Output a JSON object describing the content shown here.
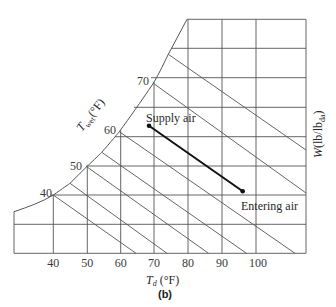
{
  "chart_data": {
    "type": "psychrometric",
    "title": "",
    "panel_label": "(b)",
    "xlabel": "T_d (°F)",
    "xlabel_main": "T",
    "xlabel_sub": "d",
    "xlabel_unit": " (°F)",
    "ylabel": "W(lb/lb_da)",
    "ylabel_main": "W(lb/lb",
    "ylabel_sub": "da",
    "ylabel_close": ")",
    "wetbulb_label": "T_wet(°F)",
    "wetbulb_main": "T",
    "wetbulb_sub": "wet",
    "wetbulb_unit": "(°F)",
    "x_ticks": [
      "40",
      "50",
      "60",
      "70",
      "80",
      "90",
      "100"
    ],
    "wetbulb_ticks": [
      "40",
      "50",
      "60",
      "70"
    ],
    "grid": true,
    "wetbulb_lines_F": [
      40,
      45,
      50,
      55,
      60,
      70,
      75
    ],
    "process": {
      "points": [
        {
          "label": "Supply air",
          "Td_F": 68
        },
        {
          "label": "Entering air",
          "Td_F": 96
        }
      ]
    }
  },
  "labels": {
    "supply": "Supply air",
    "entering": "Entering air"
  }
}
